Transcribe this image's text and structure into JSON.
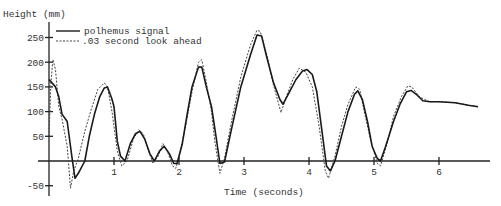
{
  "chart_data": {
    "type": "line",
    "title": "",
    "ylabel": "Height (mm)",
    "xlabel": "Time (seconds)",
    "xlim": [
      0,
      6.7
    ],
    "ylim": [
      -60,
      265
    ],
    "x_ticks": [
      1,
      2,
      3,
      4,
      5,
      6
    ],
    "y_ticks": [
      250,
      200,
      150,
      100,
      50,
      -50
    ],
    "grid": false,
    "legend_position": "top-left",
    "series": [
      {
        "name": "polhemus signal",
        "style": "solid",
        "x": [
          0,
          0.1,
          0.15,
          0.2,
          0.28,
          0.35,
          0.4,
          0.45,
          0.55,
          0.62,
          0.7,
          0.78,
          0.85,
          0.9,
          0.97,
          1.0,
          1.05,
          1.1,
          1.17,
          1.25,
          1.33,
          1.4,
          1.47,
          1.55,
          1.62,
          1.7,
          1.77,
          1.85,
          1.92,
          1.97,
          2.05,
          2.12,
          2.2,
          2.3,
          2.35,
          2.42,
          2.5,
          2.57,
          2.63,
          2.7,
          2.8,
          2.95,
          3.1,
          3.2,
          3.27,
          3.35,
          3.45,
          3.55,
          3.6,
          3.7,
          3.8,
          3.9,
          3.97,
          4.05,
          4.12,
          4.2,
          4.27,
          4.33,
          4.4,
          4.5,
          4.6,
          4.7,
          4.75,
          4.82,
          4.9,
          4.97,
          5.05,
          5.1,
          5.18,
          5.3,
          5.4,
          5.5,
          5.57,
          5.65,
          5.75,
          5.86,
          6.0,
          6.25,
          6.45,
          6.6
        ],
        "values": [
          165,
          150,
          130,
          95,
          80,
          10,
          -35,
          -25,
          0,
          50,
          95,
          130,
          148,
          150,
          125,
          110,
          40,
          10,
          0,
          35,
          55,
          60,
          45,
          15,
          0,
          20,
          30,
          15,
          -5,
          -5,
          35,
          90,
          150,
          190,
          190,
          150,
          110,
          50,
          -5,
          -2,
          60,
          150,
          215,
          255,
          253,
          210,
          160,
          125,
          115,
          140,
          165,
          182,
          185,
          175,
          140,
          60,
          -10,
          -20,
          0,
          50,
          100,
          135,
          142,
          125,
          80,
          30,
          5,
          0,
          30,
          80,
          115,
          140,
          143,
          135,
          122,
          120,
          120,
          118,
          113,
          110
        ]
      },
      {
        "name": ".03 second look ahead",
        "style": "dashed",
        "x": [
          0,
          0.03,
          0.06,
          0.1,
          0.15,
          0.2,
          0.28,
          0.33,
          0.38,
          0.45,
          0.55,
          0.65,
          0.75,
          0.85,
          0.9,
          0.97,
          1.05,
          1.12,
          1.2,
          1.3,
          1.38,
          1.45,
          1.52,
          1.6,
          1.68,
          1.75,
          1.82,
          1.9,
          1.95,
          2.02,
          2.1,
          2.2,
          2.3,
          2.35,
          2.42,
          2.5,
          2.55,
          2.63,
          2.7,
          2.8,
          2.95,
          3.1,
          3.2,
          3.25,
          3.35,
          3.45,
          3.57,
          3.65,
          3.75,
          3.85,
          3.95,
          4.05,
          4.15,
          4.25,
          4.3,
          4.4,
          4.5,
          4.6,
          4.72,
          4.78,
          4.85,
          4.95,
          5.05,
          5.1,
          5.2,
          5.3,
          5.42,
          5.52,
          5.58,
          5.7,
          5.85,
          6.0,
          6.25,
          6.45,
          6.6
        ],
        "values": [
          50,
          160,
          205,
          185,
          110,
          85,
          30,
          -55,
          -20,
          5,
          60,
          105,
          145,
          158,
          150,
          100,
          20,
          -10,
          0,
          45,
          63,
          55,
          25,
          -5,
          10,
          35,
          20,
          -10,
          -15,
          20,
          70,
          140,
          200,
          205,
          160,
          100,
          40,
          -25,
          5,
          75,
          170,
          235,
          265,
          262,
          215,
          155,
          98,
          130,
          165,
          188,
          180,
          150,
          75,
          -20,
          -35,
          10,
          70,
          115,
          150,
          145,
          100,
          40,
          -5,
          -10,
          35,
          90,
          130,
          152,
          150,
          130,
          120,
          120,
          118,
          113,
          110
        ]
      }
    ]
  },
  "axes": {
    "y_label": "Height (mm)",
    "x_label": "Time (seconds)",
    "y_tick_labels": [
      "250",
      "200",
      "150",
      "100",
      "50",
      "-50"
    ],
    "x_tick_labels": [
      "1",
      "2",
      "3",
      "4",
      "5",
      "6"
    ]
  },
  "legend": {
    "items": [
      {
        "label": "polhemus signal",
        "style": "solid"
      },
      {
        "label": ".03 second look ahead",
        "style": "dashed"
      }
    ]
  }
}
